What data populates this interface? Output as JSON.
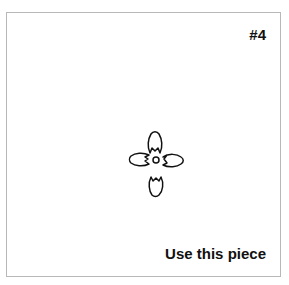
{
  "piece": {
    "number_label": "#4",
    "action_label": "Use this piece",
    "figure_icon": "four-petal-pinwheel-figure"
  }
}
